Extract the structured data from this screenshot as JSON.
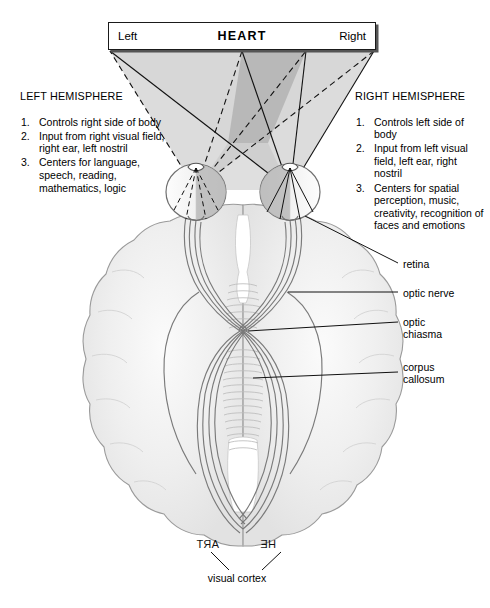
{
  "figure": {
    "type": "anatomical-diagram"
  },
  "stimulus": {
    "left_label": "Left",
    "center_label": "HEART",
    "right_label": "Right"
  },
  "hemispheres": [
    {
      "id": "left",
      "title": "LEFT HEMISPHERE",
      "items": [
        {
          "num": "1.",
          "text": "Controls right side of body"
        },
        {
          "num": "2.",
          "text": "Input from right visual field, right ear, left nostril"
        },
        {
          "num": "3.",
          "text": "Centers for language, speech, reading, mathematics, logic"
        }
      ]
    },
    {
      "id": "right",
      "title": "RIGHT HEMISPHERE",
      "items": [
        {
          "num": "1.",
          "text": "Controls left side of body"
        },
        {
          "num": "2.",
          "text": "Input from left visual field, left ear, right nostril"
        },
        {
          "num": "3.",
          "text": "Centers for spatial perception, music, creativity, recognition of faces and emotions"
        }
      ]
    }
  ],
  "callouts": [
    {
      "id": "retina",
      "text": "retina"
    },
    {
      "id": "optic-nerve",
      "text": "optic nerve"
    },
    {
      "id": "optic-chiasma",
      "text": "optic\nchiasma"
    },
    {
      "id": "corpus-callosum",
      "text": "corpus\ncallosum"
    }
  ],
  "cortex": {
    "label": "visual\ncortex"
  },
  "projected_image": {
    "left_occipital_text": "ART",
    "right_occipital_text": "HE",
    "note": "text appears mirrored/reversed on the cortex"
  },
  "colors": {
    "brain_fill": "#ededed",
    "brain_outline": "#8c8c8c",
    "cone_light": "#d6d6d6",
    "cone_overlap": "#b5b5b5",
    "line": "#1a1a1a",
    "tract": "#707070"
  }
}
